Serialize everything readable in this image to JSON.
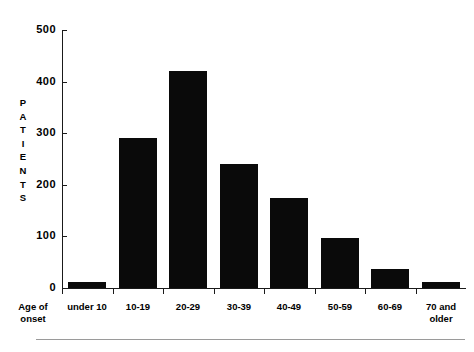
{
  "chart_data": {
    "type": "bar",
    "title": "",
    "xlabel": "Age of onset",
    "ylabel": "PATIENTS",
    "categories": [
      "under 10",
      "10-19",
      "20-29",
      "30-39",
      "40-49",
      "50-59",
      "60-69",
      "70 and older"
    ],
    "values": [
      12,
      290,
      420,
      240,
      175,
      97,
      37,
      12
    ],
    "ylim": [
      0,
      500
    ],
    "yticks": [
      0,
      100,
      200,
      300,
      400,
      500
    ],
    "ytick_labels": [
      "0",
      "100",
      "200",
      "300",
      "400",
      "500"
    ],
    "grid": false,
    "legend": null,
    "bar_color": "#0a0a0a",
    "axis_color": "#1a1a1a"
  },
  "axes": {
    "y_title_letters": [
      "P",
      "A",
      "T",
      "I",
      "E",
      "N",
      "T",
      "S"
    ],
    "x_title_lines": [
      "Age of",
      "onset"
    ],
    "last_category_lines": [
      "70 and",
      "older"
    ]
  }
}
